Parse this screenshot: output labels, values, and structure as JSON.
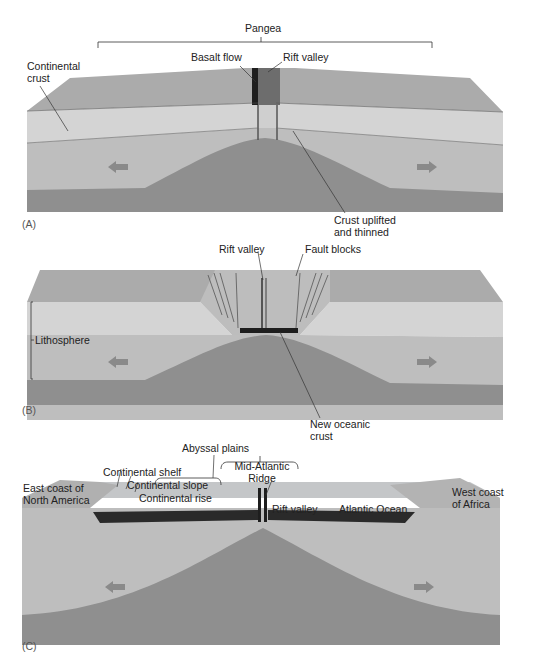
{
  "figure": {
    "panels": [
      {
        "id": "A",
        "tag": "(A)",
        "labels": {
          "pangea": "Pangea",
          "continental_crust": "Continental\ncrust",
          "basalt_flow": "Basalt flow",
          "rift_valley": "Rift valley",
          "crust_uplifted": "Crust uplifted\nand thinned"
        }
      },
      {
        "id": "B",
        "tag": "(B)",
        "labels": {
          "rift_valley": "Rift valley",
          "fault_blocks": "Fault blocks",
          "lithosphere": "Lithosphere",
          "new_oceanic_crust": "New oceanic\ncrust"
        }
      },
      {
        "id": "C",
        "tag": "(C)",
        "labels": {
          "abyssal_plains": "Abyssal plains",
          "mid_atlantic_ridge": "Mid-Atlantic\nRidge",
          "east_coast": "East coast of\nNorth America",
          "continental_shelf": "Continental shelf",
          "continental_slope": "Continental slope",
          "continental_rise": "Continental rise",
          "rift_valley": "Rift valley",
          "atlantic_ocean": "Atlantic Ocean",
          "west_coast": "West coast\nof Africa"
        }
      }
    ],
    "colors": {
      "land_surface": "#a9a9a9",
      "crust": "#d2d2d2",
      "mantle_light": "#bdbdbd",
      "asthenosphere": "#8e8e8e",
      "ocean_crust": "#2a2a2a",
      "arrow": "#8a8a8a",
      "water": "#c9cdd0"
    }
  }
}
